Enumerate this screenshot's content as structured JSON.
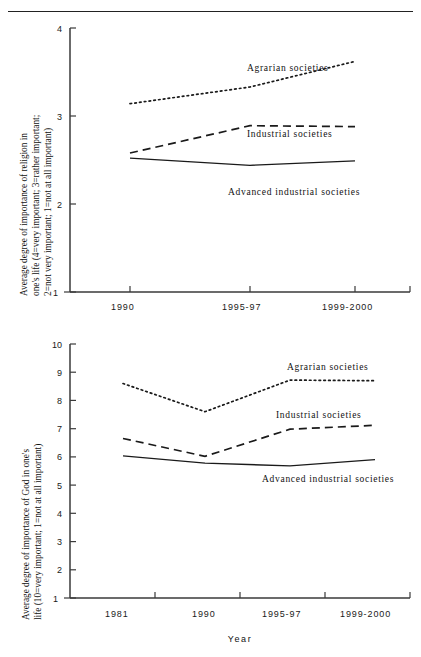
{
  "page": {
    "divider": "horizontal-rule"
  },
  "chart_data": [
    {
      "id": "religion-importance",
      "type": "line",
      "title": "",
      "xlabel": "",
      "ylabel": "Average degree of importance of religion in one's life (4=very important; 3=rather important; 2=not very important; 1=not at all important)",
      "ylabel_lines": [
        "Average degree of importance of religion in",
        "one's life (4=very important; 3=rather important;",
        "2=not very important; 1=not at all important)"
      ],
      "categories": [
        "1990",
        "1995-97",
        "1999-2000"
      ],
      "yticks": [
        "1",
        "2",
        "3",
        "4"
      ],
      "ylim": [
        1,
        4
      ],
      "grid": false,
      "legend_position": "inline-right",
      "series": [
        {
          "name": "Agrarian societies",
          "style": "dotted",
          "values": [
            3.14,
            3.33,
            3.62
          ]
        },
        {
          "name": "Industrial societies",
          "style": "dashed",
          "values": [
            2.58,
            2.89,
            2.88
          ]
        },
        {
          "name": "Advanced industrial societies",
          "style": "solid",
          "values": [
            2.52,
            2.44,
            2.49
          ]
        }
      ]
    },
    {
      "id": "god-importance",
      "type": "line",
      "title": "",
      "xlabel": "Year",
      "ylabel": "Average degree of importance of God in one's life (10=very important; 1=not at all important)",
      "ylabel_lines": [
        "Average degree of importance of God in one's",
        "life (10=very important; 1=not at all important)"
      ],
      "categories": [
        "1981",
        "1990",
        "1995-97",
        "1999-2000"
      ],
      "yticks": [
        "1",
        "2",
        "3",
        "4",
        "5",
        "6",
        "7",
        "8",
        "9",
        "10"
      ],
      "ylim": [
        1,
        10
      ],
      "grid": false,
      "legend_position": "inline-right",
      "series": [
        {
          "name": "Agrarian societies",
          "style": "dotted",
          "values": [
            8.6,
            7.6,
            8.72,
            8.7
          ]
        },
        {
          "name": "Industrial societies",
          "style": "dashed",
          "values": [
            6.65,
            6.02,
            6.98,
            7.12
          ]
        },
        {
          "name": "Advanced industrial societies",
          "style": "solid",
          "values": [
            6.04,
            5.78,
            5.68,
            5.9
          ]
        }
      ]
    }
  ]
}
